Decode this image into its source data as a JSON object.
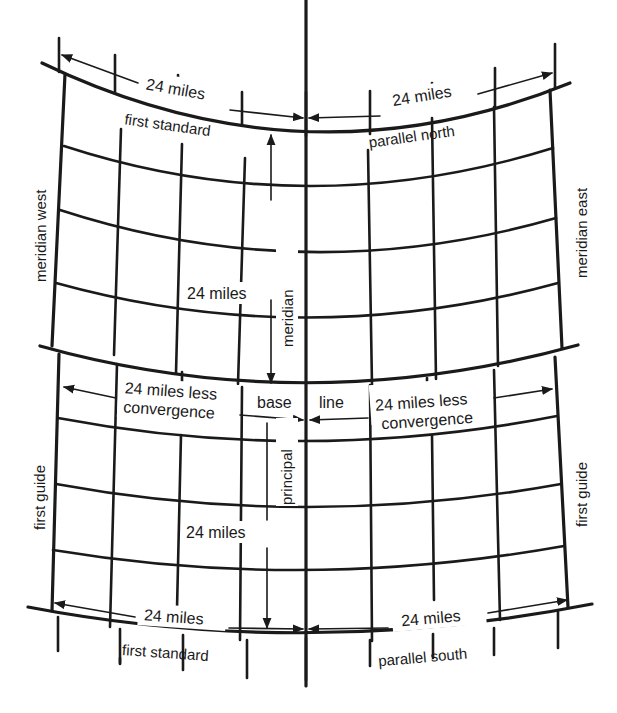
{
  "diagram": {
    "colors": {
      "ink": "#1a1a1a",
      "paper": "#ffffff"
    },
    "labels": {
      "top_left_distance": "24 miles",
      "top_right_distance": "24 miles",
      "top_parallel_left": "first standard",
      "top_parallel_right": "parallel north",
      "guide_meridian_west_upper": "meridian west",
      "guide_meridian_east_upper": "meridian east",
      "upper_vertical_distance": "24 miles",
      "principal_meridian_upper": "meridian",
      "base_line_left": "base",
      "base_line_right": "line",
      "baseline_left_distance_1": "24 miles less",
      "baseline_left_distance_2": "convergence",
      "baseline_right_distance_1": "24 miles less",
      "baseline_right_distance_2": "convergence",
      "principal_meridian_lower": "principal",
      "guide_meridian_west_lower": "first guide",
      "guide_meridian_east_lower": "first guide",
      "lower_vertical_distance": "24 miles",
      "bottom_left_distance": "24 miles",
      "bottom_right_distance": "24 miles",
      "bottom_parallel_left": "first standard",
      "bottom_parallel_right": "parallel south"
    }
  }
}
